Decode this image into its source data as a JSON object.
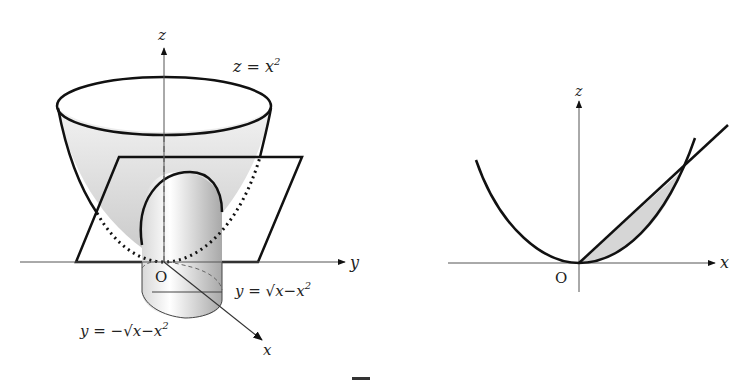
{
  "left_figure": {
    "axes": {
      "z": "z",
      "y": "y",
      "x": "x",
      "origin": "O"
    },
    "labels": {
      "surface": "z = x",
      "surface_exp": "2",
      "upper_boundary": "y = √x−x",
      "upper_boundary_exp": "2",
      "lower_boundary": "y = −√x−x",
      "lower_boundary_exp": "2"
    }
  },
  "right_figure": {
    "axes": {
      "z": "z",
      "x": "x",
      "origin": "O"
    },
    "curves": [
      "parabola z = x^2",
      "line z = x"
    ],
    "shaded_region": "between line and parabola, 0 ≤ x ≤ 1"
  },
  "colors": {
    "stroke": "#111111",
    "axis": "#555555",
    "shade": "#d6d6d6"
  }
}
